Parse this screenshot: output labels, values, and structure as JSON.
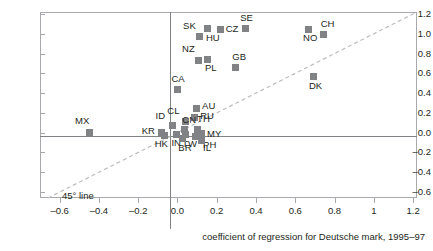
{
  "chart_data": {
    "type": "scatter",
    "title": "",
    "xlabel": "coefficient of regression for Deutsche mark, 1995–97",
    "ylabel": "",
    "xlim": [
      -0.7,
      1.22
    ],
    "ylim": [
      -0.66,
      1.22
    ],
    "grid": false,
    "legend": "none",
    "xticks": [
      "–0.6",
      "–0.4",
      "–0.2",
      "0.0",
      "0.2",
      "0.4",
      "0.6",
      "0.8",
      "1",
      "1.2"
    ],
    "xtick_values": [
      -0.6,
      -0.4,
      -0.2,
      0.0,
      0.2,
      0.4,
      0.6,
      0.8,
      1.0,
      1.2
    ],
    "yticks": [
      "1.2",
      "1.0",
      "0.8",
      "0.6",
      "0.4",
      "0.2",
      "0.0",
      "–0.2",
      "–0.4",
      "–0.6"
    ],
    "ytick_values": [
      1.2,
      1.0,
      0.8,
      0.6,
      0.4,
      0.2,
      0.0,
      -0.2,
      -0.4,
      -0.6
    ],
    "annotations": [
      {
        "name": "45-degree-line",
        "text": "45° line"
      }
    ],
    "reference_lines": {
      "zero_horizontal": 0.0,
      "zero_vertical": 0.0,
      "diagonal": "y = x (45° dashed)"
    },
    "points": [
      {
        "label": "MX",
        "x": -0.45,
        "y": 0.0,
        "lx": -14,
        "ly": -17
      },
      {
        "label": "SK",
        "x": 0.11,
        "y": 0.97,
        "lx": -16,
        "ly": -16
      },
      {
        "label": "HU",
        "x": 0.155,
        "y": 1.05,
        "lx": -2,
        "ly": 4
      },
      {
        "label": "CZ",
        "x": 0.22,
        "y": 1.04,
        "lx": 5,
        "ly": -6
      },
      {
        "label": "SE",
        "x": 0.345,
        "y": 1.05,
        "lx": -5,
        "ly": -16
      },
      {
        "label": "NO",
        "x": 0.665,
        "y": 1.04,
        "lx": -5,
        "ly": 3
      },
      {
        "label": "CH",
        "x": 0.745,
        "y": 0.99,
        "lx": -3,
        "ly": -16
      },
      {
        "label": "NZ",
        "x": 0.105,
        "y": 0.73,
        "lx": -16,
        "ly": -16
      },
      {
        "label": "PL",
        "x": 0.155,
        "y": 0.74,
        "lx": -3,
        "ly": 4
      },
      {
        "label": "GB",
        "x": 0.295,
        "y": 0.655,
        "lx": -3,
        "ly": -16
      },
      {
        "label": "DK",
        "x": 0.695,
        "y": 0.565,
        "lx": -5,
        "ly": 4
      },
      {
        "label": "CA",
        "x": 0.0,
        "y": 0.435,
        "lx": -6,
        "ly": -16
      },
      {
        "label": "AU",
        "x": 0.095,
        "y": 0.245,
        "lx": 6,
        "ly": -7
      },
      {
        "label": "RU",
        "x": 0.085,
        "y": 0.155,
        "lx": 6,
        "ly": -6
      },
      {
        "label": "CL",
        "x": 0.04,
        "y": 0.115,
        "lx": -18,
        "ly": -15
      },
      {
        "label": "ID",
        "x": -0.025,
        "y": 0.075,
        "lx": -17,
        "ly": -14
      },
      {
        "label": "CN",
        "x": 0.035,
        "y": 0.03,
        "lx": -2,
        "ly": -15
      },
      {
        "label": "TH",
        "x": 0.1,
        "y": 0.035,
        "lx": 0,
        "ly": -15
      },
      {
        "label": "MY",
        "x": 0.12,
        "y": -0.01,
        "lx": 6,
        "ly": -5
      },
      {
        "label": "KR",
        "x": -0.08,
        "y": 0.0,
        "lx": -20,
        "ly": -7
      },
      {
        "label": "HK",
        "x": -0.065,
        "y": -0.03,
        "lx": -10,
        "ly": 3
      },
      {
        "label": "IN",
        "x": -0.005,
        "y": -0.015,
        "lx": -5,
        "ly": 4
      },
      {
        "label": "TW",
        "x": 0.04,
        "y": -0.02,
        "lx": -3,
        "ly": 4
      },
      {
        "label": "BR",
        "x": 0.025,
        "y": -0.06,
        "lx": -4,
        "ly": 4
      },
      {
        "label": "PH",
        "x": 0.09,
        "y": -0.035,
        "lx": 8,
        "ly": 4
      },
      {
        "label": "IL",
        "x": 0.12,
        "y": -0.075,
        "lx": 2,
        "ly": 3
      }
    ]
  },
  "axis": {
    "x_title": "coefficient of regression for Deutsche mark, 1995–97"
  },
  "labels": {
    "diagonal_line": "45° line"
  }
}
